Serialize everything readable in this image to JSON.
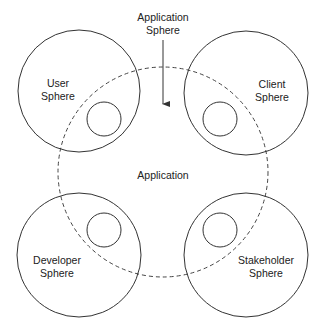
{
  "diagram": {
    "title_label": {
      "line1": "Application",
      "line2": "Sphere"
    },
    "center_label": "Application",
    "spheres": [
      {
        "id": "user",
        "line1": "User",
        "line2": "Sphere"
      },
      {
        "id": "client",
        "line1": "Client",
        "line2": "Sphere"
      },
      {
        "id": "developer",
        "line1": "Developer",
        "line2": "Sphere"
      },
      {
        "id": "stakeholder",
        "line1": "Stakeholder",
        "line2": "Sphere"
      }
    ],
    "colors": {
      "stroke": "#333333",
      "background": "#ffffff"
    }
  }
}
